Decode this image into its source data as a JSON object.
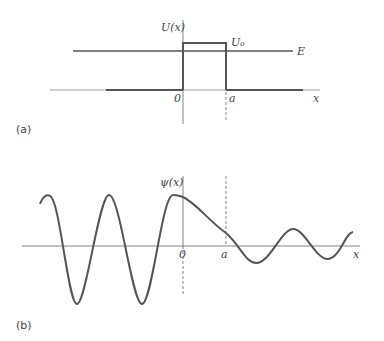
{
  "panel_a": {
    "panel_label": "(a)",
    "y_axis_label": "U(x)",
    "x_axis_label": "x",
    "barrier_label": "U₀",
    "energy_label": "E",
    "origin_label": "0",
    "width_label": "a",
    "line_color": "#555555"
  },
  "panel_b": {
    "panel_label": "(b)",
    "y_axis_label": "ψ(x)",
    "x_axis_label": "x",
    "origin_label": "0",
    "width_label": "a",
    "line_color": "#555555"
  }
}
